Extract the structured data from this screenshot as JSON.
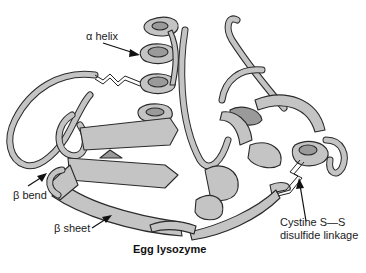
{
  "diagram": {
    "title": "Egg lysozyme",
    "type": "protein ribbon structure",
    "labels": {
      "alpha_helix": "α helix",
      "beta_bend": "β bend",
      "beta_sheet": "β sheet",
      "disulfide_line1": "Cystine S—S",
      "disulfide_line2": "disulfide linkage"
    },
    "colors": {
      "ribbon_light": "#c4c4c4",
      "ribbon_dark": "#9a9a9a",
      "outline": "#2a2a2a",
      "background": "#ffffff"
    }
  }
}
